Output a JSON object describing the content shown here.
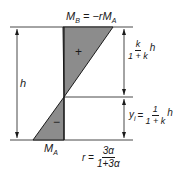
{
  "diagram": {
    "top_moment_label": "M",
    "top_moment_sub": "B",
    "top_moment_rhs": "= −rM",
    "top_moment_rhs_sub": "A",
    "bottom_moment_label": "M",
    "bottom_moment_sub": "A",
    "height_label": "h",
    "positive_sign": "+",
    "negative_sign": "−",
    "upper_dim": {
      "num": "k",
      "den": "1 + k",
      "suffix": "h"
    },
    "lower_dim": {
      "prefix": "y",
      "prefix_sub": "i",
      "eq": "=",
      "num": "1",
      "den": "1 + k",
      "suffix": "h"
    },
    "r_formula": {
      "lhs": "r =",
      "num": "3α",
      "den": "1+3α"
    },
    "colors": {
      "fill": "#8c8c8c",
      "line": "#1a1a1a"
    }
  }
}
